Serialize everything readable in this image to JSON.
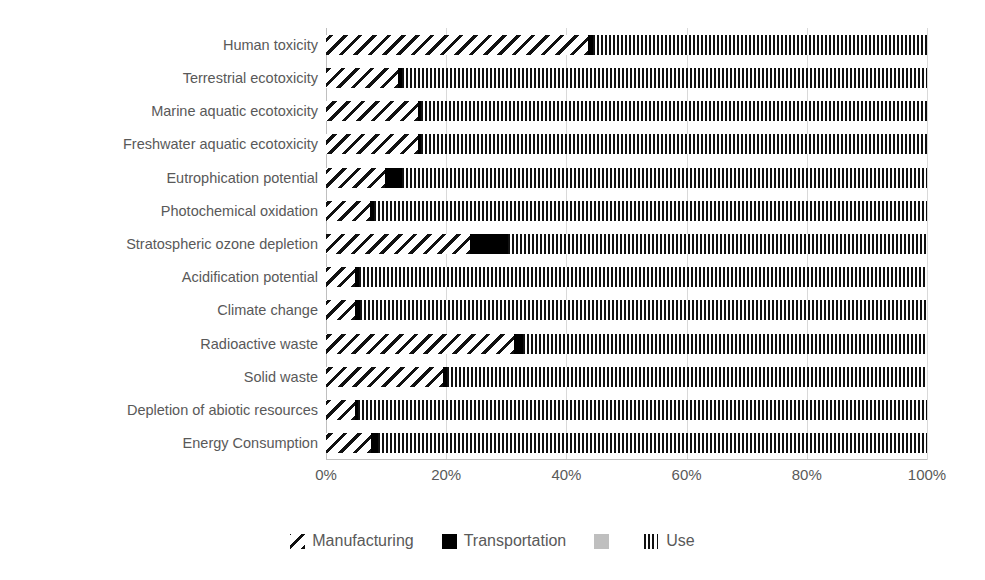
{
  "chart_data": {
    "type": "bar",
    "orientation": "horizontal",
    "stacked": true,
    "normalized": true,
    "title": "",
    "xlabel": "",
    "ylabel": "",
    "xlim": [
      0,
      100
    ],
    "xtick_labels": [
      "0%",
      "20%",
      "40%",
      "60%",
      "80%",
      "100%"
    ],
    "xtick_values": [
      0,
      20,
      40,
      60,
      80,
      100
    ],
    "grid": "vertical",
    "legend_position": "bottom",
    "categories": [
      "Human toxicity",
      "Terrestrial ecotoxicity",
      "Marine aquatic ecotoxicity",
      "Freshwater aquatic ecotoxicity",
      "Eutrophication potential",
      "Photochemical oxidation",
      "Stratospheric ozone depletion",
      "Acidification potential",
      "Climate change",
      "Radioactive waste",
      "Solid waste",
      "Depletion of abiotic resources",
      "Energy Consumption"
    ],
    "series": [
      {
        "name": "Manufacturing",
        "pattern": "diagonal-hatch",
        "color": "#111111",
        "values": [
          43.6,
          12.0,
          15.3,
          15.3,
          9.8,
          7.3,
          24.0,
          4.9,
          4.9,
          31.3,
          19.5,
          4.8,
          7.5
        ]
      },
      {
        "name": "Transportation",
        "pattern": "solid",
        "color": "#000000",
        "values": [
          0.8,
          0.6,
          0.5,
          0.5,
          2.8,
          0.7,
          6.3,
          0.6,
          0.7,
          1.5,
          0.6,
          0.6,
          1.2
        ]
      },
      {
        "name": "",
        "pattern": "solid-gray",
        "color": "#bfbfbf",
        "values": [
          0,
          0,
          0,
          0,
          0,
          0,
          0,
          0,
          0,
          0,
          0,
          0,
          0
        ]
      },
      {
        "name": "Use",
        "pattern": "vertical-stripes",
        "color": "#111111",
        "values": [
          55.6,
          87.4,
          84.2,
          84.2,
          87.4,
          92.0,
          69.7,
          94.5,
          94.4,
          67.2,
          79.9,
          94.6,
          91.3
        ]
      }
    ]
  },
  "legend": {
    "items": [
      {
        "label": "Manufacturing",
        "swatch": "diagonal-hatch-swatch"
      },
      {
        "label": "Transportation",
        "swatch": "solid-black-swatch"
      },
      {
        "label": "",
        "swatch": "solid-gray-swatch"
      },
      {
        "label": "Use",
        "swatch": "vertical-stripes-swatch"
      }
    ]
  },
  "colors": {
    "hatch": "#111111",
    "solid": "#000000",
    "gray": "#bfbfbf",
    "gridline": "#d9d9d9",
    "axis": "#bfbfbf",
    "text": "#595959",
    "background": "#ffffff"
  }
}
